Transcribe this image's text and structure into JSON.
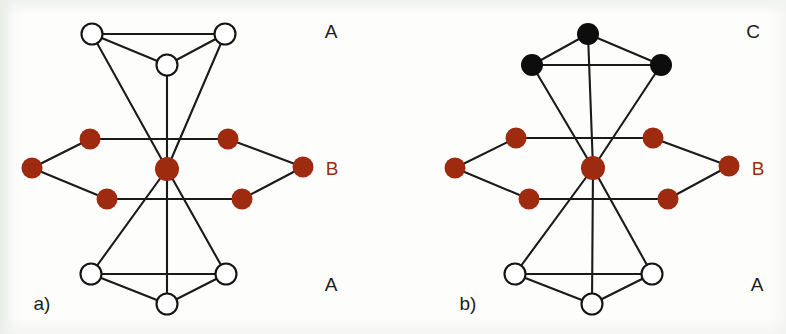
{
  "figure": {
    "width": 786,
    "height": 334,
    "background": "#fdfdfb",
    "edge_color": "#1a1a1a",
    "colors": {
      "layer_a_node": "#ffffff",
      "layer_a_stroke": "#141414",
      "layer_b_node": "#9e2a10",
      "layer_c_node": "#0d0d0d",
      "label_dark": "#1c1c1c",
      "label_red": "#9e2a10"
    }
  },
  "panels": [
    {
      "id": "panel-a",
      "caption": "a)",
      "caption_pos": {
        "x": 42,
        "y": 310
      },
      "layer_labels": [
        {
          "id": "label-a-top",
          "text": "A",
          "x": 331,
          "y": 38,
          "color": "#1c1c1c"
        },
        {
          "id": "label-a-middle",
          "text": "B",
          "x": 332,
          "y": 175,
          "color": "#9e2a10"
        },
        {
          "id": "label-a-bottom",
          "text": "A",
          "x": 331,
          "y": 291,
          "color": "#1c1c1c"
        }
      ],
      "nodes": [
        {
          "id": "a-top-left",
          "x": 92,
          "y": 34,
          "r": 10.5,
          "style": "open",
          "layer": "A"
        },
        {
          "id": "a-top-right",
          "x": 225,
          "y": 34,
          "r": 10.5,
          "style": "open",
          "layer": "A"
        },
        {
          "id": "a-top-mid",
          "x": 167,
          "y": 65,
          "r": 10.5,
          "style": "open",
          "layer": "A"
        },
        {
          "id": "a-mid-west",
          "x": 32,
          "y": 168,
          "r": 10.5,
          "style": "filled",
          "layer": "B"
        },
        {
          "id": "a-mid-nw",
          "x": 90,
          "y": 139,
          "r": 10.5,
          "style": "filled",
          "layer": "B"
        },
        {
          "id": "a-mid-sw",
          "x": 107,
          "y": 199,
          "r": 10.5,
          "style": "filled",
          "layer": "B"
        },
        {
          "id": "a-mid-center",
          "x": 167,
          "y": 169,
          "r": 12.0,
          "style": "filled",
          "layer": "B"
        },
        {
          "id": "a-mid-ne",
          "x": 228,
          "y": 139,
          "r": 10.5,
          "style": "filled",
          "layer": "B"
        },
        {
          "id": "a-mid-se",
          "x": 242,
          "y": 199,
          "r": 10.5,
          "style": "filled",
          "layer": "B"
        },
        {
          "id": "a-mid-east",
          "x": 303,
          "y": 167,
          "r": 10.5,
          "style": "filled",
          "layer": "B"
        },
        {
          "id": "a-bot-left",
          "x": 91,
          "y": 274,
          "r": 10.5,
          "style": "open",
          "layer": "A"
        },
        {
          "id": "a-bot-right",
          "x": 226,
          "y": 274,
          "r": 10.5,
          "style": "open",
          "layer": "A"
        },
        {
          "id": "a-bot-mid",
          "x": 167,
          "y": 304,
          "r": 10.5,
          "style": "open",
          "layer": "A"
        }
      ],
      "edges": [
        [
          "a-top-left",
          "a-top-right"
        ],
        [
          "a-top-left",
          "a-top-mid"
        ],
        [
          "a-top-right",
          "a-top-mid"
        ],
        [
          "a-top-left",
          "a-mid-center"
        ],
        [
          "a-top-right",
          "a-mid-center"
        ],
        [
          "a-top-mid",
          "a-mid-center"
        ],
        [
          "a-mid-west",
          "a-mid-nw"
        ],
        [
          "a-mid-west",
          "a-mid-sw"
        ],
        [
          "a-mid-nw",
          "a-mid-ne"
        ],
        [
          "a-mid-sw",
          "a-mid-se"
        ],
        [
          "a-mid-ne",
          "a-mid-east"
        ],
        [
          "a-mid-se",
          "a-mid-east"
        ],
        [
          "a-mid-center",
          "a-bot-left"
        ],
        [
          "a-mid-center",
          "a-bot-right"
        ],
        [
          "a-mid-center",
          "a-bot-mid"
        ],
        [
          "a-bot-left",
          "a-bot-right"
        ],
        [
          "a-bot-left",
          "a-bot-mid"
        ],
        [
          "a-bot-right",
          "a-bot-mid"
        ]
      ]
    },
    {
      "id": "panel-b",
      "caption": "b)",
      "caption_pos": {
        "x": 468,
        "y": 310
      },
      "layer_labels": [
        {
          "id": "label-b-top",
          "text": "C",
          "x": 753,
          "y": 38,
          "color": "#1c1c1c"
        },
        {
          "id": "label-b-middle",
          "text": "B",
          "x": 758,
          "y": 175,
          "color": "#9e2a10"
        },
        {
          "id": "label-b-bottom",
          "text": "A",
          "x": 757,
          "y": 291,
          "color": "#1c1c1c"
        }
      ],
      "nodes": [
        {
          "id": "b-top-mid",
          "x": 588,
          "y": 34,
          "r": 11.0,
          "style": "black",
          "layer": "C"
        },
        {
          "id": "b-top-left",
          "x": 532,
          "y": 65,
          "r": 11.0,
          "style": "black",
          "layer": "C"
        },
        {
          "id": "b-top-right",
          "x": 661,
          "y": 65,
          "r": 11.0,
          "style": "black",
          "layer": "C"
        },
        {
          "id": "b-mid-west",
          "x": 455,
          "y": 168,
          "r": 10.5,
          "style": "filled",
          "layer": "B"
        },
        {
          "id": "b-mid-nw",
          "x": 516,
          "y": 138,
          "r": 10.5,
          "style": "filled",
          "layer": "B"
        },
        {
          "id": "b-mid-sw",
          "x": 529,
          "y": 199,
          "r": 10.5,
          "style": "filled",
          "layer": "B"
        },
        {
          "id": "b-mid-center",
          "x": 593,
          "y": 168,
          "r": 12.0,
          "style": "filled",
          "layer": "B"
        },
        {
          "id": "b-mid-ne",
          "x": 653,
          "y": 138,
          "r": 10.5,
          "style": "filled",
          "layer": "B"
        },
        {
          "id": "b-mid-se",
          "x": 668,
          "y": 199,
          "r": 10.5,
          "style": "filled",
          "layer": "B"
        },
        {
          "id": "b-mid-east",
          "x": 729,
          "y": 166,
          "r": 10.5,
          "style": "filled",
          "layer": "B"
        },
        {
          "id": "b-bot-left",
          "x": 515,
          "y": 274,
          "r": 10.5,
          "style": "open",
          "layer": "A"
        },
        {
          "id": "b-bot-right",
          "x": 652,
          "y": 274,
          "r": 10.5,
          "style": "open",
          "layer": "A"
        },
        {
          "id": "b-bot-mid",
          "x": 592,
          "y": 304,
          "r": 10.5,
          "style": "open",
          "layer": "A"
        }
      ],
      "edges": [
        [
          "b-top-mid",
          "b-top-left"
        ],
        [
          "b-top-mid",
          "b-top-right"
        ],
        [
          "b-top-left",
          "b-top-right"
        ],
        [
          "b-top-left",
          "b-mid-center"
        ],
        [
          "b-top-right",
          "b-mid-center"
        ],
        [
          "b-top-mid",
          "b-mid-center"
        ],
        [
          "b-mid-west",
          "b-mid-nw"
        ],
        [
          "b-mid-west",
          "b-mid-sw"
        ],
        [
          "b-mid-nw",
          "b-mid-ne"
        ],
        [
          "b-mid-sw",
          "b-mid-se"
        ],
        [
          "b-mid-ne",
          "b-mid-east"
        ],
        [
          "b-mid-se",
          "b-mid-east"
        ],
        [
          "b-mid-center",
          "b-bot-left"
        ],
        [
          "b-mid-center",
          "b-bot-right"
        ],
        [
          "b-mid-center",
          "b-bot-mid"
        ],
        [
          "b-bot-left",
          "b-bot-right"
        ],
        [
          "b-bot-left",
          "b-bot-mid"
        ],
        [
          "b-bot-right",
          "b-bot-mid"
        ]
      ]
    }
  ],
  "chart_data": {
    "type": "diagram",
    "legend": [
      {
        "layer": "A",
        "marker": "open circle",
        "color": "#ffffff"
      },
      {
        "layer": "B",
        "marker": "filled circle",
        "color": "#9e2a10"
      },
      {
        "layer": "C",
        "marker": "filled circle",
        "color": "#0d0d0d"
      }
    ],
    "panels": [
      {
        "caption": "a)",
        "sequence": [
          "A",
          "B",
          "A"
        ],
        "node_count": 13,
        "edge_count": 18
      },
      {
        "caption": "b)",
        "sequence": [
          "C",
          "B",
          "A"
        ],
        "node_count": 13,
        "edge_count": 18
      }
    ]
  }
}
